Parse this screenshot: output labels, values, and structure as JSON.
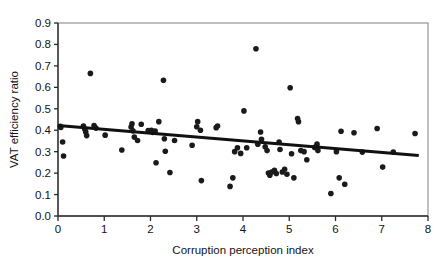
{
  "chart_data": {
    "type": "scatter",
    "title": "",
    "xlabel": "Corruption perception index",
    "ylabel": "VAT efficiency ratio",
    "xlim": [
      0,
      8
    ],
    "ylim": [
      0.0,
      0.9
    ],
    "xticks": [
      "0",
      "1",
      "2",
      "3",
      "4",
      "5",
      "6",
      "7",
      "8"
    ],
    "xtick_values": [
      0,
      1,
      2,
      3,
      4,
      5,
      6,
      7,
      8
    ],
    "yticks": [
      "0.0",
      "0.1",
      "0.2",
      "0.3",
      "0.4",
      "0.5",
      "0.6",
      "0.7",
      "0.8",
      "0.9"
    ],
    "ytick_values": [
      0.0,
      0.1,
      0.2,
      0.3,
      0.4,
      0.5,
      0.6,
      0.7,
      0.8,
      0.9
    ],
    "grid": false,
    "legend": "none",
    "marker_color": "#1a1a1a",
    "marker_size": 5.6,
    "frame_color": "#8a8a8a",
    "axis_color": "#2b2b2b",
    "background_color": "#ffffff",
    "series": [
      {
        "name": "Countries",
        "type": "scatter",
        "points": [
          [
            0.05,
            0.418
          ],
          [
            0.06,
            0.413
          ],
          [
            0.1,
            0.345
          ],
          [
            0.12,
            0.28
          ],
          [
            0.55,
            0.42
          ],
          [
            0.58,
            0.405
          ],
          [
            0.6,
            0.392
          ],
          [
            0.62,
            0.375
          ],
          [
            0.7,
            0.665
          ],
          [
            0.78,
            0.422
          ],
          [
            0.82,
            0.41
          ],
          [
            1.02,
            0.377
          ],
          [
            1.38,
            0.308
          ],
          [
            1.58,
            0.415
          ],
          [
            1.6,
            0.43
          ],
          [
            1.62,
            0.397
          ],
          [
            1.65,
            0.368
          ],
          [
            1.72,
            0.352
          ],
          [
            1.8,
            0.428
          ],
          [
            1.95,
            0.398
          ],
          [
            2.02,
            0.4
          ],
          [
            2.05,
            0.39
          ],
          [
            2.1,
            0.396
          ],
          [
            2.12,
            0.248
          ],
          [
            2.18,
            0.44
          ],
          [
            2.28,
            0.633
          ],
          [
            2.3,
            0.36
          ],
          [
            2.32,
            0.302
          ],
          [
            2.42,
            0.203
          ],
          [
            2.52,
            0.352
          ],
          [
            2.9,
            0.33
          ],
          [
            3.0,
            0.416
          ],
          [
            3.02,
            0.44
          ],
          [
            3.08,
            0.4
          ],
          [
            3.1,
            0.165
          ],
          [
            3.42,
            0.412
          ],
          [
            3.45,
            0.42
          ],
          [
            3.72,
            0.138
          ],
          [
            3.78,
            0.178
          ],
          [
            3.82,
            0.3
          ],
          [
            3.88,
            0.318
          ],
          [
            3.95,
            0.292
          ],
          [
            4.02,
            0.49
          ],
          [
            4.08,
            0.318
          ],
          [
            4.28,
            0.78
          ],
          [
            4.32,
            0.335
          ],
          [
            4.38,
            0.392
          ],
          [
            4.4,
            0.358
          ],
          [
            4.48,
            0.323
          ],
          [
            4.52,
            0.305
          ],
          [
            4.55,
            0.2
          ],
          [
            4.58,
            0.19
          ],
          [
            4.62,
            0.205
          ],
          [
            4.68,
            0.213
          ],
          [
            4.72,
            0.198
          ],
          [
            4.78,
            0.345
          ],
          [
            4.8,
            0.31
          ],
          [
            4.85,
            0.205
          ],
          [
            4.9,
            0.218
          ],
          [
            4.95,
            0.195
          ],
          [
            5.02,
            0.598
          ],
          [
            5.05,
            0.29
          ],
          [
            5.1,
            0.178
          ],
          [
            5.18,
            0.455
          ],
          [
            5.2,
            0.44
          ],
          [
            5.25,
            0.305
          ],
          [
            5.32,
            0.3
          ],
          [
            5.38,
            0.262
          ],
          [
            5.55,
            0.32
          ],
          [
            5.6,
            0.335
          ],
          [
            5.62,
            0.305
          ],
          [
            5.9,
            0.105
          ],
          [
            6.02,
            0.3
          ],
          [
            6.08,
            0.178
          ],
          [
            6.12,
            0.395
          ],
          [
            6.2,
            0.148
          ],
          [
            6.4,
            0.388
          ],
          [
            6.58,
            0.298
          ],
          [
            6.9,
            0.408
          ],
          [
            7.02,
            0.228
          ],
          [
            7.25,
            0.298
          ],
          [
            7.72,
            0.385
          ]
        ]
      },
      {
        "name": "Linear trend",
        "type": "line",
        "points": [
          [
            0.0,
            0.422
          ],
          [
            7.8,
            0.282
          ]
        ]
      }
    ]
  }
}
